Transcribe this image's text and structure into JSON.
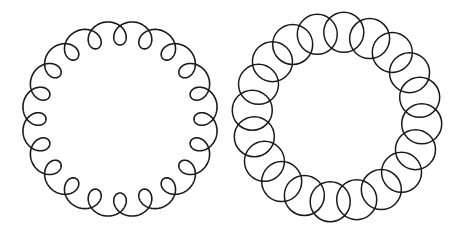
{
  "figures": [
    {
      "name": "looped-circle-trochoid",
      "description": "Closed curve traveling around a circle with small inward-facing loops",
      "loop_count": 20,
      "loops_direction": "inward",
      "stroke_color": "#1a1a1a"
    },
    {
      "name": "ring-of-overlapping-circles",
      "description": "Ring composed of overlapping circles arranged around a common center",
      "circle_count": 20,
      "stroke_color": "#1a1a1a"
    }
  ],
  "background_color": "#ffffff"
}
